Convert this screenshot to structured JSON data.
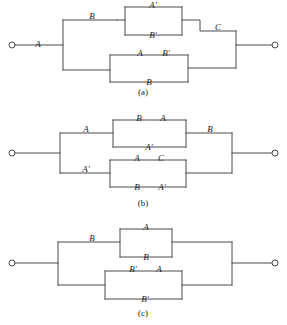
{
  "figure": {
    "panel_count": 3,
    "line_color": "#4a4a4a",
    "text_color": "#1a1a1a",
    "background": "#ffffff"
  },
  "panels": [
    {
      "id": "a",
      "caption": "(a)",
      "terminal_left": "left-terminal",
      "terminal_right": "right-terminal",
      "series_label": "A",
      "branches": {
        "upper": {
          "lead_label": "B",
          "block": {
            "top": "A'",
            "bottom": "B'"
          }
        },
        "lower": {
          "lead_label": "",
          "block": {
            "top_left": "A",
            "top_right": "B'",
            "bottom": "B"
          }
        }
      },
      "merge_label": "C",
      "labels": [
        "A",
        "B",
        "A'",
        "B'",
        "A",
        "B'",
        "B",
        "C"
      ]
    },
    {
      "id": "b",
      "caption": "(b)",
      "terminal_left": "left-terminal",
      "terminal_right": "right-terminal",
      "branches": {
        "upper": {
          "lead_label": "A",
          "block": {
            "top_left": "B",
            "top_right": "A",
            "bottom": "A'"
          }
        },
        "lower": {
          "lead_label": "A'",
          "block": {
            "top_left": "A",
            "top_right": "C",
            "bottom_left": "B",
            "bottom_right": "A'"
          }
        }
      },
      "merge_label": "B",
      "labels": [
        "A",
        "B",
        "A",
        "A'",
        "A'",
        "A",
        "C",
        "B",
        "A'",
        "B"
      ]
    },
    {
      "id": "c",
      "caption": "(c)",
      "terminal_left": "left-terminal",
      "terminal_right": "right-terminal",
      "branches": {
        "upper": {
          "lead_label": "B",
          "block": {
            "top": "A",
            "bottom": "B"
          }
        },
        "lower": {
          "lead_label": "",
          "block": {
            "top_left": "B'",
            "top_right": "A",
            "bottom": "B'"
          }
        }
      },
      "merge_label": "",
      "labels": [
        "B",
        "A",
        "B",
        "B'",
        "A",
        "B'"
      ]
    }
  ]
}
